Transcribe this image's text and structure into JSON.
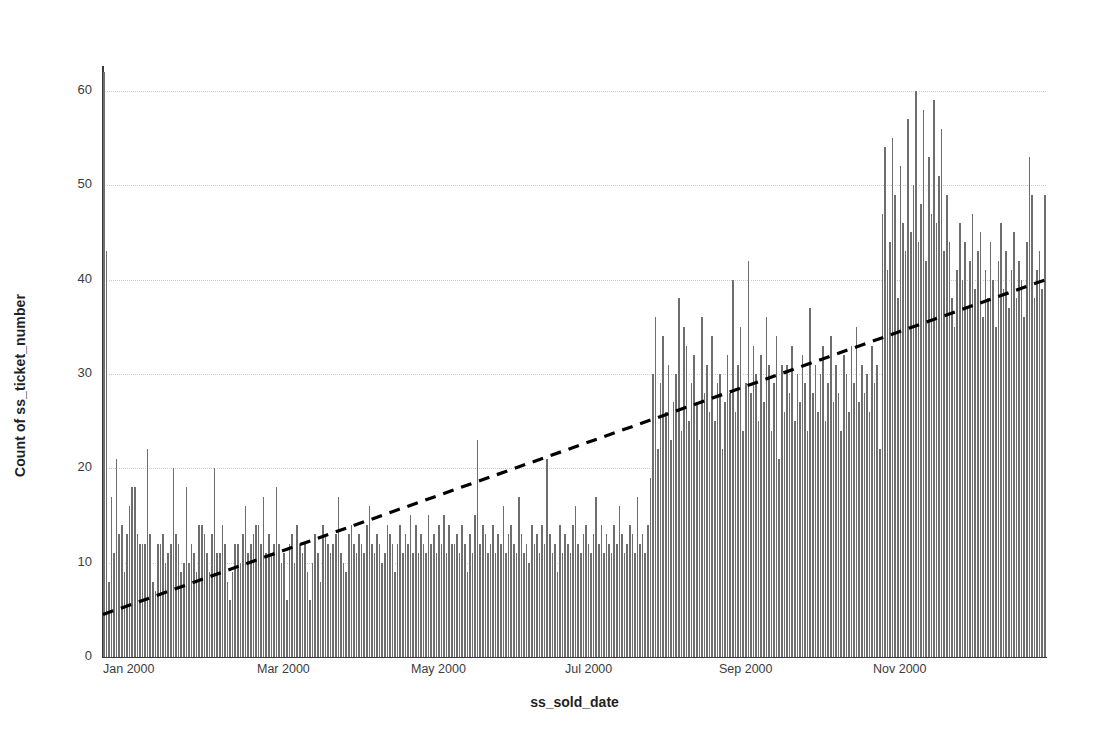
{
  "chart_data": {
    "type": "bar",
    "title": "",
    "subtitle": "",
    "xlabel": "ss_sold_date",
    "ylabel": "Count of ss_ticket_number",
    "ylim": [
      0,
      62
    ],
    "yticks": [
      0,
      10,
      20,
      30,
      40,
      50,
      60
    ],
    "ytick_labels": [
      "0",
      "10",
      "20",
      "30",
      "40",
      "50",
      "60"
    ],
    "xtick_labels": [
      "Jan 2000",
      "Mar 2000",
      "May 2000",
      "Jul 2000",
      "Sep 2000",
      "Nov 2000"
    ],
    "xtick_positions_px": [
      103,
      257,
      411,
      565,
      719,
      873
    ],
    "grid": "horizontal-dotted",
    "legend": "none",
    "bar_color": "#6e6e6e",
    "trendline": {
      "style": "dashed",
      "color": "#000000",
      "start_value": 4.5,
      "end_value": 40.0,
      "label": "trend"
    },
    "categories": [
      "2000-01-01",
      "2000-01-02",
      "2000-01-03",
      "2000-01-04",
      "2000-01-05",
      "2000-01-06",
      "2000-01-07",
      "2000-01-08",
      "2000-01-09",
      "2000-01-10",
      "2000-01-11",
      "2000-01-12",
      "2000-01-13",
      "2000-01-14",
      "2000-01-15",
      "2000-01-16",
      "2000-01-17",
      "2000-01-18",
      "2000-01-19",
      "2000-01-20",
      "2000-01-21",
      "2000-01-22",
      "2000-01-23",
      "2000-01-24",
      "2000-01-25",
      "2000-01-26",
      "2000-01-27",
      "2000-01-28",
      "2000-01-29",
      "2000-01-30",
      "2000-01-31",
      "2000-02-01",
      "2000-02-02",
      "2000-02-03",
      "2000-02-04",
      "2000-02-05",
      "2000-02-06",
      "2000-02-07",
      "2000-02-08",
      "2000-02-09",
      "2000-02-10",
      "2000-02-11",
      "2000-02-12",
      "2000-02-13",
      "2000-02-14",
      "2000-02-15",
      "2000-02-16",
      "2000-02-17",
      "2000-02-18",
      "2000-02-19",
      "2000-02-20",
      "2000-02-21",
      "2000-02-22",
      "2000-02-23",
      "2000-02-24",
      "2000-02-25",
      "2000-02-26",
      "2000-02-27",
      "2000-02-28",
      "2000-02-29",
      "2000-03-01",
      "2000-03-02",
      "2000-03-03",
      "2000-03-04",
      "2000-03-05",
      "2000-03-06",
      "2000-03-07",
      "2000-03-08",
      "2000-03-09",
      "2000-03-10",
      "2000-03-11",
      "2000-03-12",
      "2000-03-13",
      "2000-03-14",
      "2000-03-15",
      "2000-03-16",
      "2000-03-17",
      "2000-03-18",
      "2000-03-19",
      "2000-03-20",
      "2000-03-21",
      "2000-03-22",
      "2000-03-23",
      "2000-03-24",
      "2000-03-25",
      "2000-03-26",
      "2000-03-27",
      "2000-03-28",
      "2000-03-29",
      "2000-03-30",
      "2000-03-31",
      "2000-04-01",
      "2000-04-02",
      "2000-04-03",
      "2000-04-04",
      "2000-04-05",
      "2000-04-06",
      "2000-04-07",
      "2000-04-08",
      "2000-04-09",
      "2000-04-10",
      "2000-04-11",
      "2000-04-12",
      "2000-04-13",
      "2000-04-14",
      "2000-04-15",
      "2000-04-16",
      "2000-04-17",
      "2000-04-18",
      "2000-04-19",
      "2000-04-20",
      "2000-04-21",
      "2000-04-22",
      "2000-04-23",
      "2000-04-24",
      "2000-04-25",
      "2000-04-26",
      "2000-04-27",
      "2000-04-28",
      "2000-04-29",
      "2000-04-30",
      "2000-05-01",
      "2000-05-02",
      "2000-05-03",
      "2000-05-04",
      "2000-05-05",
      "2000-05-06",
      "2000-05-07",
      "2000-05-08",
      "2000-05-09",
      "2000-05-10",
      "2000-05-11",
      "2000-05-12",
      "2000-05-13",
      "2000-05-14",
      "2000-05-15",
      "2000-05-16",
      "2000-05-17",
      "2000-05-18",
      "2000-05-19",
      "2000-05-20",
      "2000-05-21",
      "2000-05-22",
      "2000-05-23",
      "2000-05-24",
      "2000-05-25",
      "2000-05-26",
      "2000-05-27",
      "2000-05-28",
      "2000-05-29",
      "2000-05-30",
      "2000-05-31",
      "2000-06-01",
      "2000-06-02",
      "2000-06-03",
      "2000-06-04",
      "2000-06-05",
      "2000-06-06",
      "2000-06-07",
      "2000-06-08",
      "2000-06-09",
      "2000-06-10",
      "2000-06-11",
      "2000-06-12",
      "2000-06-13",
      "2000-06-14",
      "2000-06-15",
      "2000-06-16",
      "2000-06-17",
      "2000-06-18",
      "2000-06-19",
      "2000-06-20",
      "2000-06-21",
      "2000-06-22",
      "2000-06-23",
      "2000-06-24",
      "2000-06-25",
      "2000-06-26",
      "2000-06-27",
      "2000-06-28",
      "2000-06-29",
      "2000-06-30",
      "2000-07-01",
      "2000-07-02",
      "2000-07-03",
      "2000-07-04",
      "2000-07-05",
      "2000-07-06",
      "2000-07-07",
      "2000-07-08",
      "2000-07-09",
      "2000-07-10",
      "2000-07-11",
      "2000-07-12",
      "2000-07-13",
      "2000-07-14",
      "2000-07-15",
      "2000-07-16",
      "2000-07-17",
      "2000-07-18",
      "2000-07-19",
      "2000-07-20",
      "2000-07-21",
      "2000-07-22",
      "2000-07-23",
      "2000-07-24",
      "2000-07-25",
      "2000-07-26",
      "2000-07-27",
      "2000-07-28",
      "2000-07-29",
      "2000-07-30",
      "2000-07-31",
      "2000-08-01",
      "2000-08-02",
      "2000-08-03",
      "2000-08-04",
      "2000-08-05",
      "2000-08-06",
      "2000-08-07",
      "2000-08-08",
      "2000-08-09",
      "2000-08-10",
      "2000-08-11",
      "2000-08-12",
      "2000-08-13",
      "2000-08-14",
      "2000-08-15",
      "2000-08-16",
      "2000-08-17",
      "2000-08-18",
      "2000-08-19",
      "2000-08-20",
      "2000-08-21",
      "2000-08-22",
      "2000-08-23",
      "2000-08-24",
      "2000-08-25",
      "2000-08-26",
      "2000-08-27",
      "2000-08-28",
      "2000-08-29",
      "2000-08-30",
      "2000-08-31",
      "2000-09-01",
      "2000-09-02",
      "2000-09-03",
      "2000-09-04",
      "2000-09-05",
      "2000-09-06",
      "2000-09-07",
      "2000-09-08",
      "2000-09-09",
      "2000-09-10",
      "2000-09-11",
      "2000-09-12",
      "2000-09-13",
      "2000-09-14",
      "2000-09-15",
      "2000-09-16",
      "2000-09-17",
      "2000-09-18",
      "2000-09-19",
      "2000-09-20",
      "2000-09-21",
      "2000-09-22",
      "2000-09-23",
      "2000-09-24",
      "2000-09-25",
      "2000-09-26",
      "2000-09-27",
      "2000-09-28",
      "2000-09-29",
      "2000-09-30",
      "2000-10-01",
      "2000-10-02",
      "2000-10-03",
      "2000-10-04",
      "2000-10-05",
      "2000-10-06",
      "2000-10-07",
      "2000-10-08",
      "2000-10-09",
      "2000-10-10",
      "2000-10-11",
      "2000-10-12",
      "2000-10-13",
      "2000-10-14",
      "2000-10-15",
      "2000-10-16",
      "2000-10-17",
      "2000-10-18",
      "2000-10-19",
      "2000-10-20",
      "2000-10-21",
      "2000-10-22",
      "2000-10-23",
      "2000-10-24",
      "2000-10-25",
      "2000-10-26",
      "2000-10-27",
      "2000-10-28",
      "2000-10-29",
      "2000-10-30",
      "2000-10-31",
      "2000-11-01",
      "2000-11-02",
      "2000-11-03",
      "2000-11-04",
      "2000-11-05",
      "2000-11-06",
      "2000-11-07",
      "2000-11-08",
      "2000-11-09",
      "2000-11-10",
      "2000-11-11",
      "2000-11-12",
      "2000-11-13",
      "2000-11-14",
      "2000-11-15",
      "2000-11-16",
      "2000-11-17",
      "2000-11-18",
      "2000-11-19",
      "2000-11-20",
      "2000-11-21",
      "2000-11-22",
      "2000-11-23",
      "2000-11-24",
      "2000-11-25",
      "2000-11-26",
      "2000-11-27",
      "2000-11-28",
      "2000-11-29",
      "2000-11-30",
      "2000-12-01",
      "2000-12-02",
      "2000-12-03",
      "2000-12-04",
      "2000-12-05",
      "2000-12-06",
      "2000-12-07",
      "2000-12-08",
      "2000-12-09",
      "2000-12-10",
      "2000-12-11",
      "2000-12-12",
      "2000-12-13",
      "2000-12-14",
      "2000-12-15",
      "2000-12-16",
      "2000-12-17",
      "2000-12-18",
      "2000-12-19",
      "2000-12-20",
      "2000-12-21",
      "2000-12-22",
      "2000-12-23",
      "2000-12-24",
      "2000-12-25",
      "2000-12-26",
      "2000-12-27",
      "2000-12-28",
      "2000-12-29",
      "2000-12-30",
      "2000-12-31"
    ],
    "values": [
      62,
      43,
      8,
      17,
      11,
      21,
      13,
      14,
      9,
      13,
      16,
      18,
      18,
      13,
      12,
      12,
      12,
      22,
      13,
      8,
      7,
      12,
      12,
      13,
      10,
      11,
      12,
      20,
      13,
      12,
      9,
      10,
      18,
      10,
      12,
      11,
      9,
      14,
      14,
      13,
      11,
      9,
      13,
      20,
      11,
      11,
      14,
      12,
      8,
      6,
      9,
      12,
      12,
      10,
      13,
      16,
      11,
      12,
      13,
      14,
      14,
      12,
      17,
      11,
      13,
      11,
      12,
      18,
      12,
      10,
      11,
      6,
      12,
      13,
      10,
      14,
      12,
      11,
      12,
      9,
      6,
      10,
      13,
      11,
      8,
      14,
      13,
      12,
      11,
      12,
      13,
      17,
      11,
      10,
      9,
      13,
      14,
      12,
      11,
      13,
      12,
      11,
      14,
      16,
      12,
      11,
      13,
      12,
      10,
      11,
      14,
      13,
      12,
      9,
      12,
      14,
      11,
      13,
      12,
      15,
      11,
      14,
      11,
      13,
      12,
      11,
      15,
      12,
      13,
      11,
      14,
      12,
      15,
      11,
      14,
      12,
      12,
      13,
      11,
      14,
      12,
      9,
      13,
      11,
      15,
      23,
      12,
      14,
      13,
      11,
      12,
      14,
      11,
      13,
      12,
      16,
      11,
      13,
      14,
      12,
      11,
      17,
      13,
      11,
      12,
      10,
      14,
      12,
      13,
      11,
      14,
      12,
      21,
      13,
      11,
      12,
      9,
      14,
      11,
      13,
      12,
      11,
      14,
      16,
      12,
      11,
      13,
      14,
      12,
      11,
      13,
      17,
      12,
      14,
      11,
      13,
      12,
      11,
      14,
      12,
      16,
      13,
      11,
      12,
      14,
      13,
      11,
      17,
      12,
      13,
      11,
      14,
      19,
      30,
      36,
      22,
      29,
      34,
      26,
      31,
      23,
      27,
      30,
      38,
      24,
      35,
      33,
      25,
      29,
      32,
      27,
      23,
      36,
      28,
      31,
      26,
      34,
      25,
      29,
      30,
      22,
      27,
      32,
      28,
      40,
      26,
      31,
      35,
      24,
      29,
      42,
      28,
      33,
      30,
      25,
      32,
      27,
      36,
      31,
      24,
      29,
      34,
      21,
      31,
      26,
      31,
      28,
      33,
      25,
      30,
      27,
      32,
      29,
      24,
      37,
      28,
      31,
      26,
      30,
      33,
      25,
      29,
      34,
      27,
      31,
      28,
      24,
      32,
      30,
      26,
      33,
      29,
      35,
      27,
      31,
      28,
      30,
      26,
      33,
      29,
      31,
      22,
      47,
      54,
      41,
      44,
      55,
      49,
      38,
      52,
      46,
      43,
      57,
      45,
      50,
      60,
      44,
      48,
      58,
      42,
      53,
      47,
      59,
      46,
      51,
      56,
      43,
      49,
      44,
      38,
      35,
      41,
      46,
      40,
      44,
      37,
      42,
      47,
      39,
      43,
      45,
      36,
      41,
      38,
      44,
      40,
      35,
      42,
      46,
      39,
      43,
      37,
      41,
      45,
      38,
      42,
      40,
      36,
      44,
      53,
      49,
      38,
      41,
      43,
      39,
      49
    ]
  },
  "axes": {
    "y_label": "Count of ss_ticket_number",
    "x_label": "ss_sold_date"
  }
}
